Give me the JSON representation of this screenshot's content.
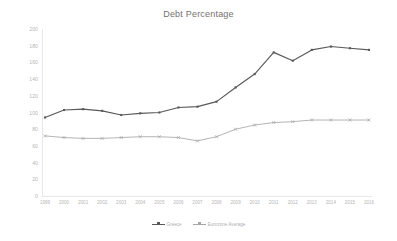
{
  "chart_data": {
    "type": "line",
    "title": "Debt Percentage",
    "xlabel": "",
    "ylabel": "",
    "ylim": [
      0,
      200
    ],
    "yticks": [
      0,
      20,
      40,
      60,
      80,
      100,
      120,
      140,
      160,
      180,
      200
    ],
    "ytick_labels": [
      "0",
      "20",
      "40",
      "60",
      "80",
      "100",
      "120",
      "140",
      "160",
      "180",
      "200"
    ],
    "grid": false,
    "legend_position": "bottom",
    "categories": [
      "1999",
      "2000",
      "2001",
      "2002",
      "2003",
      "2004",
      "2005",
      "2006",
      "2007",
      "2008",
      "2009",
      "2010",
      "2011",
      "2012",
      "2013",
      "2014",
      "2015",
      "2016"
    ],
    "series": [
      {
        "name": "Greece",
        "color": "#595959",
        "marker": "square",
        "values": [
          94,
          103,
          104,
          102,
          97,
          99,
          100,
          106,
          107,
          113,
          130,
          146,
          172,
          162,
          175,
          179,
          177,
          175
        ]
      },
      {
        "name": "Eurozone Average",
        "color": "#a6a6a6",
        "marker": "cross",
        "values": [
          72,
          70,
          69,
          69,
          70,
          71,
          71,
          70,
          66,
          71,
          80,
          85,
          88,
          89,
          91,
          91,
          91,
          91
        ]
      }
    ]
  },
  "chart": {
    "title": "Debt Percentage"
  },
  "legend": {
    "entries": [
      {
        "label": "Greece"
      },
      {
        "label": "Eurozone Average"
      }
    ]
  },
  "colors": {
    "greece": "#595959",
    "eurozone": "#a6a6a6",
    "title_text": "#767171",
    "tick_text": "#b7b7b7",
    "axis_line": "#e8e8e8",
    "background": "#ffffff"
  }
}
